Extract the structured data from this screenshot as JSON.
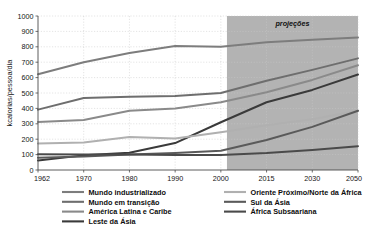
{
  "chart_data": {
    "type": "line",
    "title": "",
    "xlabel": "",
    "ylabel": "kcalorias/pessoa/dia",
    "ylim": [
      0,
      1000
    ],
    "ytick_values": [
      0,
      100,
      200,
      300,
      400,
      500,
      600,
      700,
      800,
      900,
      1000
    ],
    "ytick_labels": [
      "0",
      "100",
      "200",
      "300",
      "400",
      "500",
      "600",
      "700",
      "800",
      "900",
      "1000"
    ],
    "x": [
      1962,
      1970,
      1980,
      1990,
      2000,
      2015,
      2030,
      2050
    ],
    "xtick_labels": [
      "1962",
      "1970",
      "1980",
      "1990",
      "2000",
      "2015",
      "2030",
      "2050"
    ],
    "grid": true,
    "legend_position": "bottom",
    "annotations": [
      {
        "text": "projeções",
        "x_start": 2002,
        "x_end": 2050,
        "shaded": true,
        "shade_color": "#b3b3b3"
      }
    ],
    "series": [
      {
        "name": "Mundo industrializado",
        "color": "#7d7d7d",
        "width": 2.0,
        "values": [
          622,
          700,
          760,
          805,
          800,
          830,
          845,
          860
        ]
      },
      {
        "name": "Mundo em transição",
        "color": "#6e6e6e",
        "width": 2.0,
        "values": [
          392,
          468,
          475,
          480,
          500,
          580,
          650,
          725
        ]
      },
      {
        "name": "América Latina e Caribe",
        "color": "#8a8a8a",
        "width": 2.0,
        "values": [
          312,
          325,
          385,
          400,
          440,
          505,
          585,
          680
        ]
      },
      {
        "name": "Leste da Ásia",
        "color": "#3a3a3a",
        "width": 2.0,
        "values": [
          62,
          95,
          112,
          175,
          310,
          440,
          520,
          620
        ]
      },
      {
        "name": "Oriente Próximo/Norte da África",
        "color": "#b0b0b0",
        "width": 2.0,
        "values": [
          172,
          178,
          215,
          205,
          245,
          290,
          330,
          385
        ]
      },
      {
        "name": "Sul da Ásia",
        "color": "#5a5a5a",
        "width": 2.0,
        "values": [
          80,
          88,
          100,
          110,
          125,
          195,
          280,
          385
        ]
      },
      {
        "name": "África Subsaariana",
        "color": "#4a4a4a",
        "width": 2.0,
        "values": [
          102,
          100,
          100,
          98,
          98,
          110,
          130,
          155
        ]
      }
    ]
  },
  "legend": {
    "columns": [
      {
        "items": [
          {
            "label": "Mundo industrializado",
            "color": "#7d7d7d"
          },
          {
            "label": "Mundo em transição",
            "color": "#6e6e6e"
          },
          {
            "label": "América Latina e Caribe",
            "color": "#8a8a8a"
          },
          {
            "label": "Leste da Ásia",
            "color": "#3a3a3a"
          }
        ]
      },
      {
        "items": [
          {
            "label": "Oriente Próximo/Norte da África",
            "color": "#b0b0b0"
          },
          {
            "label": "Sul da Ásia",
            "color": "#5a5a5a"
          },
          {
            "label": "África Subsaariana",
            "color": "#4a4a4a"
          }
        ]
      }
    ]
  }
}
